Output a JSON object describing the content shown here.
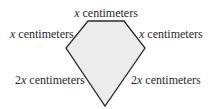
{
  "figure": {
    "shape": "pentagon",
    "fill_color": "#ececec",
    "stroke_color": "#2b2b2b",
    "labels": {
      "top": {
        "var": "x",
        "unit": " centimeters"
      },
      "upper_left": {
        "var": "x",
        "unit": " centimeters"
      },
      "upper_right": {
        "var": "x",
        "unit": " centimeters"
      },
      "lower_left": {
        "coef": "2",
        "var": "x",
        "unit": " centimeters"
      },
      "lower_right": {
        "coef": "2",
        "var": "x",
        "unit": " centimeters"
      }
    }
  }
}
